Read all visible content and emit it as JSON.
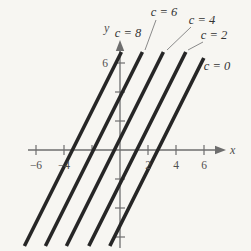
{
  "figure_name": "family-of-lines-figure",
  "colors": {
    "line": "#262626",
    "axis": "#6e6e6e",
    "tick": "#6e6e6e",
    "leader": "#8a8a8a",
    "text": "#3c3c3c",
    "background": "#f7f6f2"
  },
  "chart_data": {
    "type": "line",
    "family_equation": "y = 2x + c",
    "slope": 2,
    "c_values": [
      8,
      6,
      4,
      2,
      0
    ],
    "lines": [
      {
        "label": "c = 8",
        "c": 8,
        "x_intercept_drawn": -3.4
      },
      {
        "label": "c = 6",
        "c": 6,
        "x_intercept_drawn": -1.9
      },
      {
        "label": "c = 4",
        "c": 4,
        "x_intercept_drawn": -0.4
      },
      {
        "label": "c = 2",
        "c": 2,
        "x_intercept_drawn": 1.2
      },
      {
        "label": "c = 0",
        "c": 0,
        "x_intercept_drawn": 2.7
      }
    ],
    "xlabel": "x",
    "ylabel": "y",
    "xlim": [
      -7,
      7.5
    ],
    "ylim": [
      -7,
      7.5
    ],
    "x_ticks": [
      -6,
      -4,
      -2,
      2,
      4,
      6
    ],
    "x_tick_labels": [
      "−6",
      "−4",
      "2",
      "4",
      "6"
    ],
    "x_tick_label_values": [
      -6,
      -4,
      2,
      4,
      6
    ],
    "y_ticks": [
      -6,
      -4,
      -2,
      2,
      4,
      6
    ],
    "y_tick_labels": [
      "6"
    ],
    "y_tick_label_values": [
      6
    ],
    "grid": false,
    "legend": "labels-annotated-on-lines"
  }
}
